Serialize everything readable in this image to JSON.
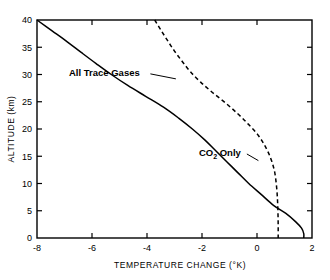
{
  "chart_data": {
    "type": "line",
    "title": "",
    "xlabel": "TEMPERATURE CHANGE  (°K)",
    "ylabel": "ALTITUDE  (km)",
    "xlim": [
      -8,
      2
    ],
    "ylim": [
      0,
      40
    ],
    "xticks": [
      -8,
      -6,
      -4,
      -2,
      0,
      2
    ],
    "xtick_labels": [
      "-8",
      "-6",
      "-4",
      "-2",
      "0",
      "2"
    ],
    "yticks": [
      0,
      5,
      10,
      15,
      20,
      25,
      30,
      35,
      40
    ],
    "ytick_labels": [
      "0",
      "5",
      "10",
      "15",
      "20",
      "25",
      "30",
      "35",
      "40"
    ],
    "grid": false,
    "legend_position": "inline-annotations",
    "tick_direction": "in",
    "frame": "box",
    "series": [
      {
        "name": "All Trace Gases",
        "style": "solid",
        "color": "#000000",
        "label_text": "All Trace Gases",
        "label_x": -5.55,
        "label_y": 30.3,
        "leader_to_x": -2.95,
        "leader_to_y": 29.2,
        "points": [
          [
            -8.0,
            40.0
          ],
          [
            -7.45,
            38.0
          ],
          [
            -6.9,
            36.0
          ],
          [
            -6.38,
            34.0
          ],
          [
            -5.85,
            32.0
          ],
          [
            -5.3,
            30.0
          ],
          [
            -4.7,
            28.0
          ],
          [
            -4.05,
            26.0
          ],
          [
            -3.4,
            24.0
          ],
          [
            -2.85,
            22.0
          ],
          [
            -2.35,
            20.0
          ],
          [
            -1.9,
            18.0
          ],
          [
            -1.5,
            16.0
          ],
          [
            -1.1,
            14.0
          ],
          [
            -0.7,
            12.0
          ],
          [
            -0.3,
            10.0
          ],
          [
            0.15,
            8.0
          ],
          [
            0.6,
            6.0
          ],
          [
            1.05,
            4.5
          ],
          [
            1.4,
            3.0
          ],
          [
            1.62,
            1.8
          ],
          [
            1.7,
            0.8
          ],
          [
            1.7,
            0.0
          ]
        ]
      },
      {
        "name": "CO2 Only",
        "style": "dashed",
        "color": "#000000",
        "label_text": "CO",
        "label_sub": "2",
        "label_text2": " Only",
        "label_x": -1.35,
        "label_y": 15.6,
        "leader_to_x": 0.05,
        "leader_to_y": 14.2,
        "dash_pattern": "4,3",
        "points": [
          [
            -3.72,
            40.0
          ],
          [
            -3.5,
            38.2
          ],
          [
            -3.25,
            36.2
          ],
          [
            -3.0,
            34.3
          ],
          [
            -2.72,
            32.4
          ],
          [
            -2.42,
            30.5
          ],
          [
            -2.05,
            28.6
          ],
          [
            -1.62,
            26.7
          ],
          [
            -1.15,
            24.8
          ],
          [
            -0.7,
            22.8
          ],
          [
            -0.3,
            20.8
          ],
          [
            0.05,
            18.8
          ],
          [
            0.3,
            16.8
          ],
          [
            0.5,
            14.6
          ],
          [
            0.63,
            12.4
          ],
          [
            0.7,
            10.0
          ],
          [
            0.74,
            7.5
          ],
          [
            0.76,
            5.0
          ],
          [
            0.77,
            2.5
          ],
          [
            0.77,
            0.0
          ]
        ]
      }
    ],
    "annotations": [
      {
        "text": "All Trace Gases",
        "at_x": -5.55,
        "at_y": 30.3
      },
      {
        "text": "CO2 Only",
        "at_x": -1.35,
        "at_y": 15.6
      }
    ]
  }
}
